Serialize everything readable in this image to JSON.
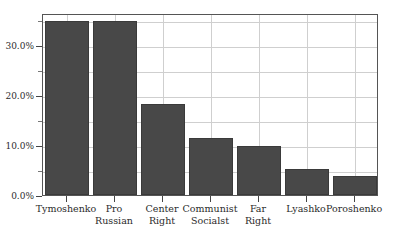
{
  "chart_data": {
    "type": "bar",
    "title": "",
    "subtitle": "",
    "xlabel": "",
    "ylabel": "",
    "categories": [
      "Tymoshenko",
      "Pro Russian",
      "Center Right",
      "Communist Socialst",
      "Far Right",
      "Lyashko",
      "Poroshenko"
    ],
    "category_lines": [
      [
        "Tymoshenko",
        ""
      ],
      [
        "Pro",
        "Russian"
      ],
      [
        "Center",
        "Right"
      ],
      [
        "Communist",
        "Socialst"
      ],
      [
        "Far",
        "Right"
      ],
      [
        "Lyashko",
        ""
      ],
      [
        "Poroshenko",
        ""
      ]
    ],
    "values": [
      34.8,
      34.8,
      18.3,
      11.4,
      9.8,
      5.2,
      3.8
    ],
    "value_labels": [
      "34.8%",
      "34.8%",
      "18.3%",
      "11.4%",
      "9.8%",
      "5.2%",
      "3.8%"
    ],
    "ylim": [
      0,
      36.4
    ],
    "ytick_values": [
      0,
      10,
      20,
      30
    ],
    "ytick_labels": [
      "0.0%",
      "10.0%",
      "20.0%",
      "30.0%"
    ],
    "yminor_values": [
      5,
      15,
      25,
      35
    ],
    "grid": true,
    "grid_orientation": "both",
    "legend": "none",
    "bar_color": "#484848",
    "grid_color": "#cfcfcf",
    "frame_color": "#555555",
    "text_color": "#2b2b2b",
    "background": "#ffffff"
  }
}
